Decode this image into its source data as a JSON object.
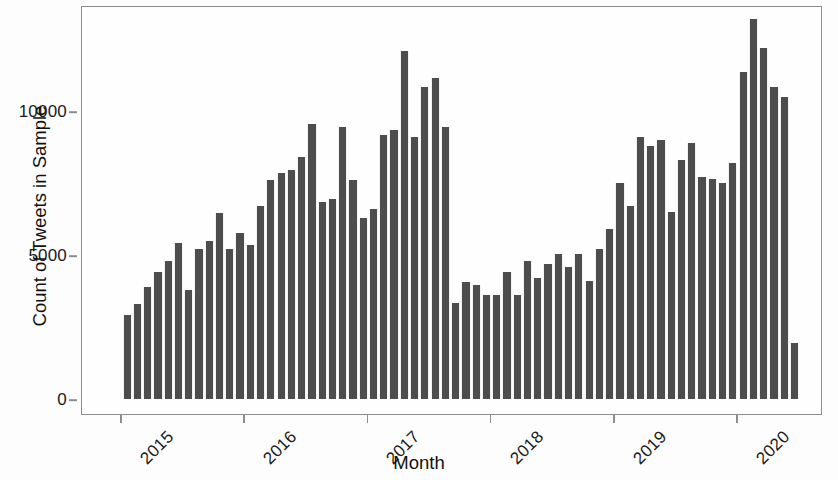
{
  "chart_data": {
    "type": "bar",
    "title": "",
    "xlabel": "Month",
    "ylabel": "Count of Tweets in Sample",
    "ylim": [
      0,
      13900
    ],
    "xlim": [
      "2014-12",
      "2020-07"
    ],
    "grid": false,
    "legend": null,
    "bar_color": "#4d4d4d",
    "y_ticks": [
      0,
      5000,
      10000
    ],
    "y_tick_labels": [
      "0",
      "5000",
      "10000"
    ],
    "x_ticks": [
      "2015",
      "2016",
      "2017",
      "2018",
      "2019",
      "2020"
    ],
    "x_tick_labels": [
      "2015",
      "2016",
      "2017",
      "2018",
      "2019",
      "2020"
    ],
    "categories": [
      "2015-01",
      "2015-02",
      "2015-03",
      "2015-04",
      "2015-05",
      "2015-06",
      "2015-07",
      "2015-08",
      "2015-09",
      "2015-10",
      "2015-11",
      "2015-12",
      "2016-01",
      "2016-02",
      "2016-03",
      "2016-04",
      "2016-05",
      "2016-06",
      "2016-07",
      "2016-08",
      "2016-09",
      "2016-10",
      "2016-11",
      "2016-12",
      "2017-01",
      "2017-02",
      "2017-03",
      "2017-04",
      "2017-05",
      "2017-06",
      "2017-07",
      "2017-08",
      "2017-09",
      "2017-10",
      "2017-11",
      "2017-12",
      "2018-01",
      "2018-02",
      "2018-03",
      "2018-04",
      "2018-05",
      "2018-06",
      "2018-07",
      "2018-08",
      "2018-09",
      "2018-10",
      "2018-11",
      "2018-12",
      "2019-01",
      "2019-02",
      "2019-03",
      "2019-04",
      "2019-05",
      "2019-06",
      "2019-07",
      "2019-08",
      "2019-09",
      "2019-10",
      "2019-11",
      "2019-12",
      "2020-01",
      "2020-02",
      "2020-03",
      "2020-04",
      "2020-05",
      "2020-06"
    ],
    "values": [
      2900,
      3300,
      3900,
      4400,
      4800,
      5400,
      3800,
      5200,
      5500,
      6450,
      5200,
      5750,
      5350,
      6700,
      7600,
      7850,
      7950,
      8400,
      9550,
      6850,
      6950,
      9450,
      7600,
      6300,
      6600,
      9150,
      9350,
      12100,
      9100,
      10850,
      11150,
      9450,
      3350,
      4050,
      3950,
      3600,
      3600,
      4400,
      3600,
      4800,
      4200,
      4700,
      5050,
      4600,
      5050,
      4100,
      5200,
      5900,
      7500,
      6700,
      9100,
      8800,
      9000,
      6500,
      8300,
      8900,
      7700,
      7650,
      7500,
      8200,
      11350,
      13200,
      12200,
      10850,
      10500,
      1950
    ]
  }
}
